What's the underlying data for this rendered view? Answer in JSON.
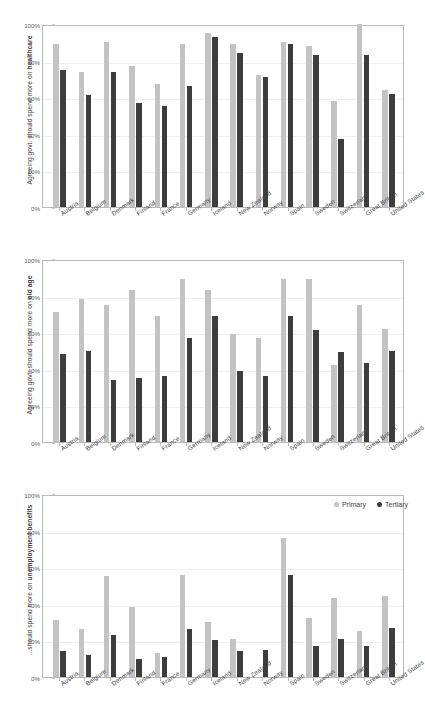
{
  "figure": {
    "background": "#ffffff",
    "primary_color": "#c3c3c3",
    "tertiary_color": "#3d3d3d"
  },
  "legend": {
    "position": "top-right of third panel",
    "entries": [
      {
        "label": "Primary",
        "color": "#c3c3c3"
      },
      {
        "label": "Tertiary",
        "color": "#3d3d3d"
      }
    ]
  },
  "yticks": [
    "0%",
    "20%",
    "40%",
    "60%",
    "80%",
    "100%"
  ],
  "categories": [
    "Austria",
    "Belgium",
    "Denmark",
    "Finland",
    "France",
    "Germany",
    "Iceland",
    "New Zealand",
    "Norway",
    "Spain",
    "Sweden",
    "Switzerland",
    "Great Britain",
    "United States"
  ],
  "chart_data": [
    {
      "type": "bar",
      "title": "",
      "ylabel_prefix": "Agreeing govt. should spend more on ",
      "ylabel_bold": "healthcare",
      "xlabel": "",
      "ylim": [
        0,
        100
      ],
      "grid": false,
      "categories": [
        "Austria",
        "Belgium",
        "Denmark",
        "Finland",
        "France",
        "Germany",
        "Iceland",
        "New Zealand",
        "Norway",
        "Spain",
        "Sweden",
        "Switzerland",
        "Great Britain",
        "United States"
      ],
      "series": [
        {
          "name": "Primary",
          "color": "#c3c3c3",
          "values": [
            89,
            74,
            90,
            77,
            67,
            89,
            95,
            89,
            72,
            90,
            88,
            58,
            100,
            64
          ]
        },
        {
          "name": "Tertiary",
          "color": "#3d3d3d",
          "values": [
            75,
            61,
            74,
            57,
            55,
            66,
            93,
            84,
            71,
            89,
            83,
            37,
            83,
            62
          ]
        }
      ]
    },
    {
      "type": "bar",
      "title": "",
      "ylabel_prefix": "Agreeing govt. should spend more on ",
      "ylabel_bold": "old age",
      "xlabel": "",
      "ylim": [
        0,
        100
      ],
      "grid": false,
      "categories": [
        "Austria",
        "Belgium",
        "Denmark",
        "Finland",
        "France",
        "Germany",
        "Iceland",
        "New Zealand",
        "Norway",
        "Spain",
        "Sweden",
        "Switzerland",
        "Great Britain",
        "United States"
      ],
      "series": [
        {
          "name": "Primary",
          "color": "#c3c3c3",
          "values": [
            71,
            78,
            75,
            83,
            69,
            89,
            83,
            59,
            57,
            89,
            89,
            42,
            75,
            62
          ]
        },
        {
          "name": "Tertiary",
          "color": "#3d3d3d",
          "values": [
            48,
            50,
            34,
            35,
            36,
            57,
            69,
            39,
            36,
            69,
            61,
            49,
            43,
            50
          ]
        }
      ]
    },
    {
      "type": "bar",
      "title": "",
      "ylabel_prefix": "...should spend more on ",
      "ylabel_bold": "unemployment benefits",
      "xlabel": "",
      "ylim": [
        0,
        100
      ],
      "grid": false,
      "categories": [
        "Austria",
        "Belgium",
        "Denmark",
        "Finland",
        "France",
        "Germany",
        "Iceland",
        "New Zealand",
        "Norway",
        "Spain",
        "Sweden",
        "Switzerland",
        "Great Britain",
        "United States"
      ],
      "series": [
        {
          "name": "Primary",
          "color": "#c3c3c3",
          "values": [
            31,
            26,
            55,
            38,
            13,
            56,
            30,
            21,
            0,
            76,
            32,
            43,
            25,
            44
          ]
        },
        {
          "name": "Tertiary",
          "color": "#3d3d3d",
          "values": [
            14,
            12,
            23,
            10,
            11,
            26,
            20,
            14,
            15,
            56,
            17,
            21,
            17,
            27
          ]
        }
      ]
    }
  ]
}
